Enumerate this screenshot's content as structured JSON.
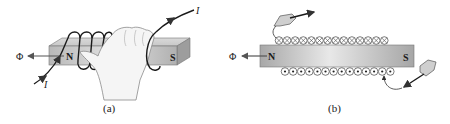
{
  "figure": {
    "panels": [
      {
        "id": "a",
        "caption": "(a)",
        "flux_symbol": "Φ",
        "north_label": "N",
        "south_label": "S",
        "current_label_in": "I",
        "current_label_out": "I",
        "description": "Right-hand rule: hand grips bar magnet with coil wound around N end; flux Φ exits from N"
      },
      {
        "id": "b",
        "caption": "(b)",
        "flux_symbol": "Φ",
        "north_label": "N",
        "south_label": "S",
        "top_conductors": {
          "count": 14,
          "symbol": "⊗",
          "meaning": "current into page"
        },
        "bottom_conductors": {
          "count": 14,
          "symbol": "⊙",
          "meaning": "current out of page"
        },
        "description": "Cross-section of solenoid around bar; dart arrows indicate current direction"
      }
    ]
  },
  "colors": {
    "wire": "#1a1a1a",
    "bar_light": "#e6e6e6",
    "bar_mid": "#c4c4c4",
    "bar_dark": "#9a9a9a",
    "hand_fill": "#f4f4f4",
    "hand_stroke": "#8a8a8a",
    "arrow": "#555555"
  }
}
